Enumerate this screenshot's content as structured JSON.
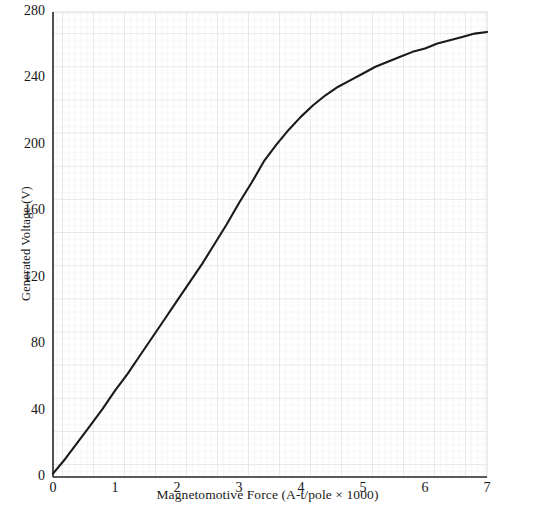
{
  "chart_data": {
    "type": "line",
    "title": "",
    "xlabel": "Magnetomotive Force (A-t/pole × 1000)",
    "ylabel": "Generated Voltage (V)",
    "xlim": [
      0,
      7
    ],
    "ylim": [
      0,
      280
    ],
    "grid": true,
    "grid_style": "graph-paper fine grid, minor every 0.1 unit, major every 0.5 unit",
    "legend": "none",
    "xticks": [
      "0",
      "1",
      "2",
      "3",
      "4",
      "5",
      "6",
      "7"
    ],
    "xtick_values": [
      0,
      1,
      2,
      3,
      4,
      5,
      6,
      7
    ],
    "yticks": [
      "0",
      "40",
      "80",
      "120",
      "160",
      "200",
      "240",
      "280"
    ],
    "ytick_values": [
      0,
      40,
      80,
      120,
      160,
      200,
      240,
      280
    ],
    "series": [
      {
        "name": "Magnetization curve",
        "color": "#1a1a1a",
        "x": [
          0,
          0.2,
          0.4,
          0.6,
          0.8,
          1.0,
          1.2,
          1.4,
          1.6,
          1.8,
          2.0,
          2.2,
          2.4,
          2.6,
          2.8,
          3.0,
          3.2,
          3.4,
          3.6,
          3.8,
          4.0,
          4.2,
          4.4,
          4.6,
          4.8,
          5.0,
          5.2,
          5.4,
          5.6,
          5.8,
          6.0,
          6.2,
          6.4,
          6.6,
          6.8,
          7.0
        ],
        "y": [
          2,
          11,
          21,
          31,
          41,
          52,
          62,
          73,
          84,
          95,
          106,
          117,
          128,
          140,
          152,
          165,
          177,
          190,
          200,
          209,
          217,
          224,
          230,
          235,
          239,
          243,
          247,
          250,
          253,
          256,
          258,
          261,
          263,
          265,
          267,
          268
        ]
      }
    ]
  },
  "axes": {
    "x_axis_label": "Magnetomotive Force (A-t/pole × 1000)",
    "y_axis_label": "Generated Voltage (V)"
  },
  "colors": {
    "curve": "#1a1a1a",
    "grid_minor": "#edeef1",
    "grid_major": "#e2e3e8",
    "axis": "#2a2a2a",
    "background": "#ffffff"
  }
}
